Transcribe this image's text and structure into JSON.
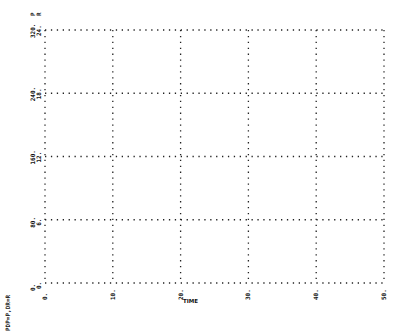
{
  "chart_data": {
    "type": "line",
    "title": "",
    "xlabel": "TIME",
    "ylabel": "P",
    "y2label": "R",
    "footer_label": "PDP=P,DR=R",
    "xlim": [
      0,
      50
    ],
    "ylim": [
      0,
      320
    ],
    "y2lim": [
      0,
      24
    ],
    "x_ticks": [
      "0.",
      "10.",
      "20.",
      "30.",
      "40.",
      "50."
    ],
    "y_ticks": [
      "0.",
      "80.",
      "160.",
      "240.",
      "320."
    ],
    "y2_ticks": [
      "0.",
      "6.",
      "12.",
      "18.",
      "24."
    ],
    "grid": true,
    "grid_style": "dotted",
    "series": [],
    "legend": "none"
  },
  "labels": {
    "x_axis": "TIME",
    "footer": "PDP=P,DR=R",
    "top_markers": [
      "P",
      "R"
    ]
  }
}
